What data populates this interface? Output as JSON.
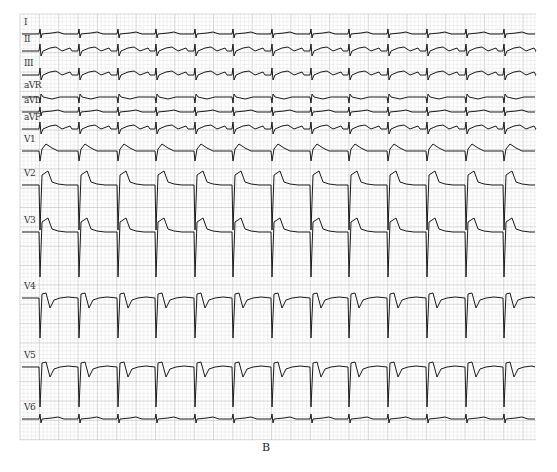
{
  "figure": {
    "caption": "B",
    "grid_color": "#d4d4d4",
    "grid_major_color": "#bdbdbd",
    "trace_color": "#1a1a1a",
    "beat_positions_x": [
      40,
      79,
      118,
      156,
      195,
      233,
      272,
      311,
      349,
      388,
      427,
      466,
      504
    ],
    "leads": [
      {
        "label": "I",
        "baseline": 34,
        "type": "small"
      },
      {
        "label": "II",
        "baseline": 51,
        "type": "small_t"
      },
      {
        "label": "III",
        "baseline": 75,
        "type": "small_t"
      },
      {
        "label": "aVR",
        "baseline": 97,
        "type": "neg"
      },
      {
        "label": "aVL",
        "baseline": 112,
        "type": "small"
      },
      {
        "label": "aVF",
        "baseline": 129,
        "type": "small_t"
      },
      {
        "label": "V1",
        "baseline": 151,
        "type": "v1"
      },
      {
        "label": "V2",
        "baseline": 185,
        "type": "deep_st"
      },
      {
        "label": "V3",
        "baseline": 232,
        "type": "deep_st"
      },
      {
        "label": "V4",
        "baseline": 298,
        "type": "v4"
      },
      {
        "label": "V5",
        "baseline": 367,
        "type": "v4"
      },
      {
        "label": "V6",
        "baseline": 419,
        "type": "small"
      }
    ]
  }
}
